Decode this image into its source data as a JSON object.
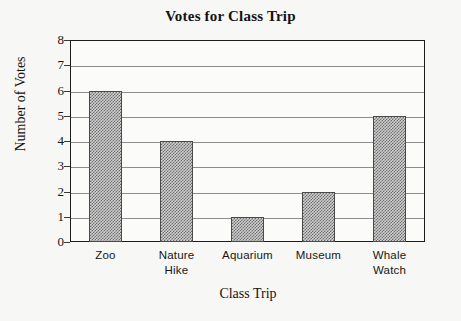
{
  "chart_data": {
    "type": "bar",
    "title": "Votes for Class Trip",
    "xlabel": "Class Trip",
    "ylabel": "Number of Votes",
    "categories": [
      "Zoo",
      "Nature Hike",
      "Aquarium",
      "Museum",
      "Whale Watch"
    ],
    "category_lines": [
      [
        "Zoo"
      ],
      [
        "Nature",
        "Hike"
      ],
      [
        "Aquarium"
      ],
      [
        "Museum"
      ],
      [
        "Whale",
        "Watch"
      ]
    ],
    "values": [
      6,
      4,
      1,
      2,
      5
    ],
    "ylim": [
      0,
      8
    ],
    "ytick_labels": [
      "0",
      "1",
      "2",
      "3",
      "4",
      "5",
      "6",
      "7",
      "8"
    ],
    "ytick_values": [
      0,
      1,
      2,
      3,
      4,
      5,
      6,
      7,
      8
    ],
    "grid": true,
    "legend": "none",
    "bar_fill": "#cfcfcf",
    "bar_hatch_color": "#6e6e6e",
    "bar_border_color": "#4a4a4a",
    "grid_color": "#8d8d8d",
    "frame_color": "#1c1c1c",
    "background_color": "#f7f7f5",
    "text_color": "#131313"
  }
}
